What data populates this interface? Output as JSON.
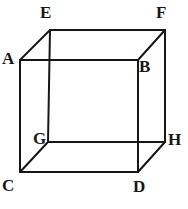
{
  "figure": {
    "kind": "cube-wireframe-diagram",
    "canvas": {
      "width": 188,
      "height": 209
    },
    "background_color": "#ffffff",
    "stroke_color": "#171717",
    "stroke_width": 2,
    "label_color": "#171717",
    "vertices": [
      {
        "id": "A",
        "label": "A",
        "x": 20,
        "y": 60,
        "face": "front"
      },
      {
        "id": "B",
        "label": "B",
        "x": 138,
        "y": 60,
        "face": "front"
      },
      {
        "id": "C",
        "label": "C",
        "x": 20,
        "y": 172,
        "face": "front"
      },
      {
        "id": "D",
        "label": "D",
        "x": 138,
        "y": 172,
        "face": "front"
      },
      {
        "id": "E",
        "label": "E",
        "x": 50,
        "y": 30,
        "face": "back"
      },
      {
        "id": "F",
        "label": "F",
        "x": 165,
        "y": 30,
        "face": "back"
      },
      {
        "id": "G",
        "label": "G",
        "x": 48,
        "y": 142,
        "face": "back"
      },
      {
        "id": "H",
        "label": "H",
        "x": 165,
        "y": 142,
        "face": "back"
      }
    ],
    "edges": [
      {
        "id": "A-B",
        "from": "A",
        "to": "B",
        "group": "front-face"
      },
      {
        "id": "B-D",
        "from": "B",
        "to": "D",
        "group": "front-face"
      },
      {
        "id": "D-C",
        "from": "D",
        "to": "C",
        "group": "front-face"
      },
      {
        "id": "C-A",
        "from": "C",
        "to": "A",
        "group": "front-face"
      },
      {
        "id": "E-F",
        "from": "E",
        "to": "F",
        "group": "back-face"
      },
      {
        "id": "F-H",
        "from": "F",
        "to": "H",
        "group": "back-face"
      },
      {
        "id": "H-G",
        "from": "H",
        "to": "G",
        "group": "back-face"
      },
      {
        "id": "G-E",
        "from": "G",
        "to": "E",
        "group": "back-face"
      },
      {
        "id": "A-E",
        "from": "A",
        "to": "E",
        "group": "connector"
      },
      {
        "id": "B-F",
        "from": "B",
        "to": "F",
        "group": "connector"
      },
      {
        "id": "C-G",
        "from": "C",
        "to": "G",
        "group": "connector"
      },
      {
        "id": "D-H",
        "from": "D",
        "to": "H",
        "group": "connector"
      }
    ]
  }
}
